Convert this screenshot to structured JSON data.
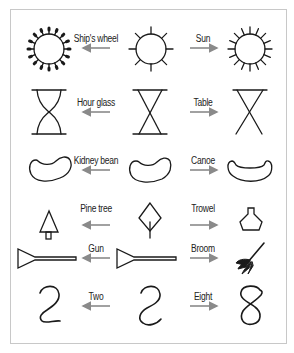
{
  "arrow_color": "#8a8a8a",
  "stroke_color": "#1a1a1a",
  "rows": [
    {
      "left_label": "Ship's wheel",
      "right_label": "Sun",
      "left_shape": "ships-wheel",
      "center_shape": "half-sun",
      "right_shape": "sun"
    },
    {
      "left_label": "Hour glass",
      "right_label": "Table",
      "left_shape": "hourglass",
      "center_shape": "crossed-x",
      "right_shape": "table"
    },
    {
      "left_label": "Kidney bean",
      "right_label": "Canoe",
      "left_shape": "kidney-bean",
      "center_shape": "bean-outline",
      "right_shape": "canoe"
    },
    {
      "left_label": "Pine tree",
      "right_label": "Trowel",
      "left_shape": "pine-tree",
      "center_shape": "diamond-with-stem",
      "right_shape": "trowel"
    },
    {
      "left_label": "Gun",
      "right_label": "Broom",
      "left_shape": "gun",
      "center_shape": "triangle-with-bar",
      "right_shape": "broom"
    },
    {
      "left_label": "Two",
      "right_label": "Eight",
      "left_shape": "numeral-two",
      "center_shape": "s-curve",
      "right_shape": "numeral-eight"
    }
  ]
}
